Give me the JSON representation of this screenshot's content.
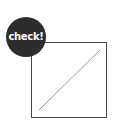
{
  "badge": {
    "label": "check!",
    "color": "#2d2d2d",
    "text_color": "#ffffff"
  },
  "box": {
    "border_color": "#4a4a4a",
    "diagonal_color": "#9a9a9a"
  }
}
